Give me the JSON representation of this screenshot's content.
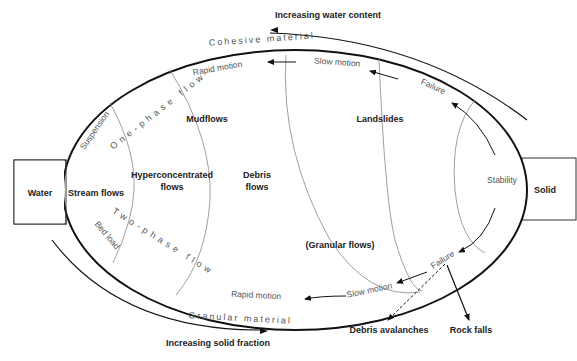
{
  "diagram": {
    "top_axis_label": "Increasing water content",
    "bottom_axis_label": "Increasing solid fraction",
    "outer_top_label": "Cohesive material",
    "outer_bottom_label": "Granular material",
    "left_box": "Water",
    "right_box": "Solid",
    "regions": {
      "stream_flows": "Stream flows",
      "hyperconcentrated_line1": "Hyperconcentrated",
      "hyperconcentrated_line2": "flows",
      "debris_line1": "Debris",
      "debris_line2": "flows",
      "mudflows": "Mudflows",
      "landslides": "Landslides",
      "granular_flows": "(Granular flows)",
      "stability": "Stability"
    },
    "sub_labels": {
      "suspension": "Suspension",
      "bed_load": "Bed load",
      "one_phase": "One-phase flow",
      "two_phase": "Two-phase flow"
    },
    "motion_labels": {
      "rapid_top": "Rapid motion",
      "slow_top": "Slow motion",
      "failure_top": "Failure",
      "rapid_bottom": "Rapid motion",
      "slow_bottom": "Slow motion",
      "failure_bottom": "Failure"
    },
    "outcomes": {
      "debris_avalanches": "Debris avalanches",
      "rock_falls": "Rock falls"
    }
  }
}
